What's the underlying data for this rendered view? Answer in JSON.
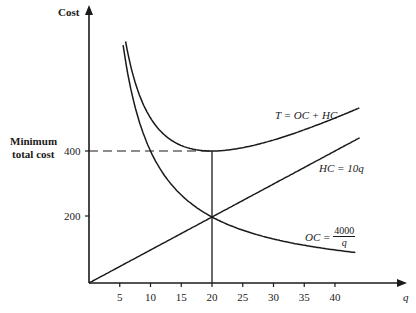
{
  "chart_data": {
    "type": "line",
    "title": "",
    "xlabel": "q",
    "ylabel": "Cost",
    "xlim": [
      0,
      47
    ],
    "ylim": [
      0,
      830
    ],
    "x_ticks": [
      5,
      10,
      15,
      20,
      25,
      30,
      35,
      40
    ],
    "y_ticks": [
      200,
      400
    ],
    "grid": false,
    "legend": "inline labels",
    "series": [
      {
        "name": "T = OC + HC",
        "formula": "4000/q + 10q",
        "x": [
          5.5,
          8,
          10,
          12,
          15,
          20,
          25,
          30,
          35,
          40,
          44
        ],
        "values": [
          782,
          580,
          500,
          453,
          417,
          400,
          410,
          433,
          464,
          500,
          531
        ]
      },
      {
        "name": "HC = 10q",
        "formula": "10q",
        "x": [
          0,
          10,
          20,
          30,
          40,
          44
        ],
        "values": [
          0,
          100,
          200,
          300,
          400,
          440
        ]
      },
      {
        "name": "OC = 4000/q",
        "formula": "4000/q",
        "x": [
          3,
          5,
          8,
          10,
          15,
          20,
          25,
          30,
          35,
          40,
          44
        ],
        "values": [
          760,
          800,
          500,
          400,
          267,
          200,
          160,
          133,
          114,
          100,
          91
        ]
      }
    ],
    "annotations": [
      {
        "text": "Minimum total cost",
        "at": {
          "x": 0,
          "y": 400
        }
      },
      {
        "text": "dashed line at y=400 from y-axis to q=20"
      },
      {
        "text": "vertical line at q=20 from x-axis to T minimum"
      }
    ]
  },
  "labels": {
    "y_axis": "Cost",
    "x_axis": "q",
    "min_line1": "Minimum",
    "min_line2": "total cost",
    "y400": "400",
    "y200": "200",
    "total": "T = OC + HC",
    "hc": "HC = 10q",
    "oc_prefix": "OC =",
    "oc_num": "4000",
    "oc_den": "q",
    "xt": [
      "5",
      "10",
      "15",
      "20",
      "25",
      "30",
      "35",
      "40"
    ]
  }
}
